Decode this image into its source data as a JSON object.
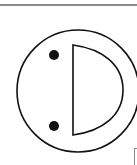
{
  "figure": {
    "type": "schematic-symbol",
    "colors": {
      "stroke": "#111111",
      "fill_dot": "#111111",
      "background": "#ffffff",
      "rule": "#8a8a8a",
      "corner_box": "#8a8a8a"
    },
    "circle": {
      "cx": 78,
      "cy": 91,
      "r": 61,
      "stroke_width": 1.6
    },
    "d_shape": {
      "x_left": 73,
      "y_top": 45,
      "y_bottom": 135,
      "x_right": 123,
      "stroke_width": 1.6
    },
    "dots": [
      {
        "cx": 54,
        "cy": 55,
        "r": 5
      },
      {
        "cx": 54,
        "cy": 126,
        "r": 5
      }
    ]
  }
}
